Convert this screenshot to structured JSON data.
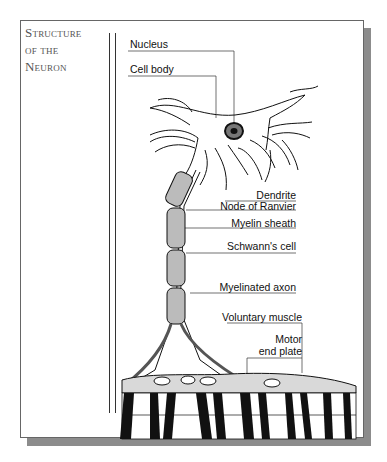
{
  "title": {
    "line1": "Structure",
    "line2": "of the",
    "line3": "Neuron"
  },
  "labels": {
    "nucleus": "Nucleus",
    "cell_body": "Cell body",
    "dendrite": "Dendrite",
    "node_of_ranvier": "Node of Ranvier",
    "myelin_sheath": "Myelin sheath",
    "schwanns_cell": "Schwann's cell",
    "myelinated_axon": "Myelinated axon",
    "voluntary_muscle": "Voluntary muscle",
    "motor_end_plate_1": "Motor",
    "motor_end_plate_2": "end plate"
  },
  "colors": {
    "frame_border": "#666666",
    "shadow": "#8c8c8c",
    "title_text": "#555555",
    "ink": "#111111",
    "muscle_membrane": "#d9d9d9"
  }
}
